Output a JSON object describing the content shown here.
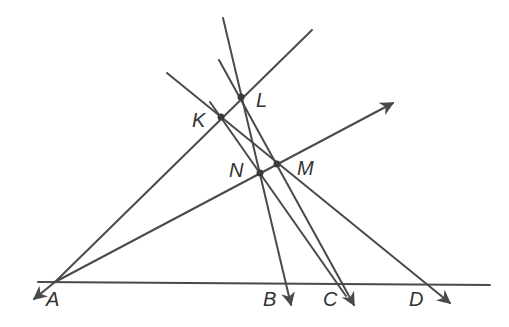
{
  "diagram": {
    "type": "geometry",
    "stroke_color": "#4a4a4a",
    "points": {
      "A": {
        "label": "A",
        "x": 55,
        "y": 282
      },
      "B": {
        "label": "B",
        "x": 285,
        "y": 283
      },
      "C": {
        "label": "C",
        "x": 342,
        "y": 284
      },
      "D": {
        "label": "D",
        "x": 425,
        "y": 284
      },
      "K": {
        "label": "K",
        "x": 221,
        "y": 117
      },
      "L": {
        "label": "L",
        "x": 241,
        "y": 97
      },
      "M": {
        "label": "M",
        "x": 277,
        "y": 164
      },
      "N": {
        "label": "N",
        "x": 260,
        "y": 173
      }
    },
    "lines": [
      {
        "name": "baseline-AD",
        "from": [
          38,
          282
        ],
        "to": [
          490,
          285
        ]
      },
      {
        "name": "ray-A-K-L",
        "from": [
          55,
          282
        ],
        "to": [
          312,
          30
        ]
      },
      {
        "name": "ray-A-N-M",
        "from": [
          55,
          282
        ],
        "to": [
          393,
          103
        ],
        "arrow_end": true
      },
      {
        "name": "ray-L-B",
        "from": [
          223,
          18
        ],
        "to": [
          291,
          305
        ],
        "arrow_end": true
      },
      {
        "name": "ray-L-C",
        "from": [
          219,
          60
        ],
        "to": [
          354,
          305
        ],
        "arrow_end": true
      },
      {
        "name": "ray-K-N-C",
        "from": [
          210,
          102
        ],
        "to": [
          348,
          300
        ]
      },
      {
        "name": "ray-K-M-D",
        "from": [
          167,
          73
        ],
        "to": [
          450,
          303
        ],
        "arrow_end": true
      },
      {
        "name": "ray-A-left",
        "from": [
          55,
          282
        ],
        "to": [
          33,
          300
        ],
        "arrow_end": true
      }
    ]
  }
}
